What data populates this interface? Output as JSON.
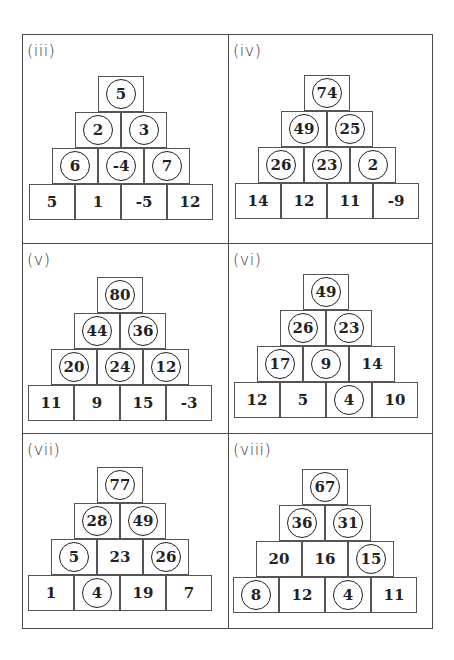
{
  "panels": [
    {
      "label": "(iii)",
      "rows": [
        [
          {
            "value": "5",
            "circled": true
          }
        ],
        [
          {
            "value": "2",
            "circled": true
          },
          {
            "value": "3",
            "circled": true
          }
        ],
        [
          {
            "value": "6",
            "circled": true
          },
          {
            "value": "-4",
            "circled": true
          },
          {
            "value": "7",
            "circled": true
          }
        ],
        [
          {
            "value": "5",
            "circled": false
          },
          {
            "value": "1",
            "circled": false
          },
          {
            "value": "-5",
            "circled": false
          },
          {
            "value": "12",
            "circled": false
          }
        ]
      ]
    },
    {
      "label": "(iv)",
      "rows": [
        [
          {
            "value": "74",
            "circled": true
          }
        ],
        [
          {
            "value": "49",
            "circled": true
          },
          {
            "value": "25",
            "circled": true
          }
        ],
        [
          {
            "value": "26",
            "circled": true
          },
          {
            "value": "23",
            "circled": true
          },
          {
            "value": "2",
            "circled": true
          }
        ],
        [
          {
            "value": "14",
            "circled": false
          },
          {
            "value": "12",
            "circled": false
          },
          {
            "value": "11",
            "circled": false
          },
          {
            "value": "-9",
            "circled": false
          }
        ]
      ]
    },
    {
      "label": "(v)",
      "rows": [
        [
          {
            "value": "80",
            "circled": true
          }
        ],
        [
          {
            "value": "44",
            "circled": true
          },
          {
            "value": "36",
            "circled": true
          }
        ],
        [
          {
            "value": "20",
            "circled": true
          },
          {
            "value": "24",
            "circled": true
          },
          {
            "value": "12",
            "circled": true
          }
        ],
        [
          {
            "value": "11",
            "circled": false
          },
          {
            "value": "9",
            "circled": false
          },
          {
            "value": "15",
            "circled": false
          },
          {
            "value": "-3",
            "circled": false
          }
        ]
      ]
    },
    {
      "label": "(vi)",
      "rows": [
        [
          {
            "value": "49",
            "circled": true
          }
        ],
        [
          {
            "value": "26",
            "circled": true
          },
          {
            "value": "23",
            "circled": true
          }
        ],
        [
          {
            "value": "17",
            "circled": true
          },
          {
            "value": "9",
            "circled": true
          },
          {
            "value": "14",
            "circled": false
          }
        ],
        [
          {
            "value": "12",
            "circled": false
          },
          {
            "value": "5",
            "circled": false
          },
          {
            "value": "4",
            "circled": true
          },
          {
            "value": "10",
            "circled": false
          }
        ]
      ]
    },
    {
      "label": "(vii)",
      "rows": [
        [
          {
            "value": "77",
            "circled": true
          }
        ],
        [
          {
            "value": "28",
            "circled": true
          },
          {
            "value": "49",
            "circled": true
          }
        ],
        [
          {
            "value": "5",
            "circled": true
          },
          {
            "value": "23",
            "circled": false
          },
          {
            "value": "26",
            "circled": true
          }
        ],
        [
          {
            "value": "1",
            "circled": false
          },
          {
            "value": "4",
            "circled": true
          },
          {
            "value": "19",
            "circled": false
          },
          {
            "value": "7",
            "circled": false
          }
        ]
      ]
    },
    {
      "label": "(viii)",
      "rows": [
        [
          {
            "value": "67",
            "circled": true
          }
        ],
        [
          {
            "value": "36",
            "circled": true
          },
          {
            "value": "31",
            "circled": true
          }
        ],
        [
          {
            "value": "20",
            "circled": false
          },
          {
            "value": "16",
            "circled": false
          },
          {
            "value": "15",
            "circled": true
          }
        ],
        [
          {
            "value": "8",
            "circled": true
          },
          {
            "value": "12",
            "circled": false
          },
          {
            "value": "4",
            "circled": true
          },
          {
            "value": "11",
            "circled": false
          }
        ]
      ]
    }
  ]
}
